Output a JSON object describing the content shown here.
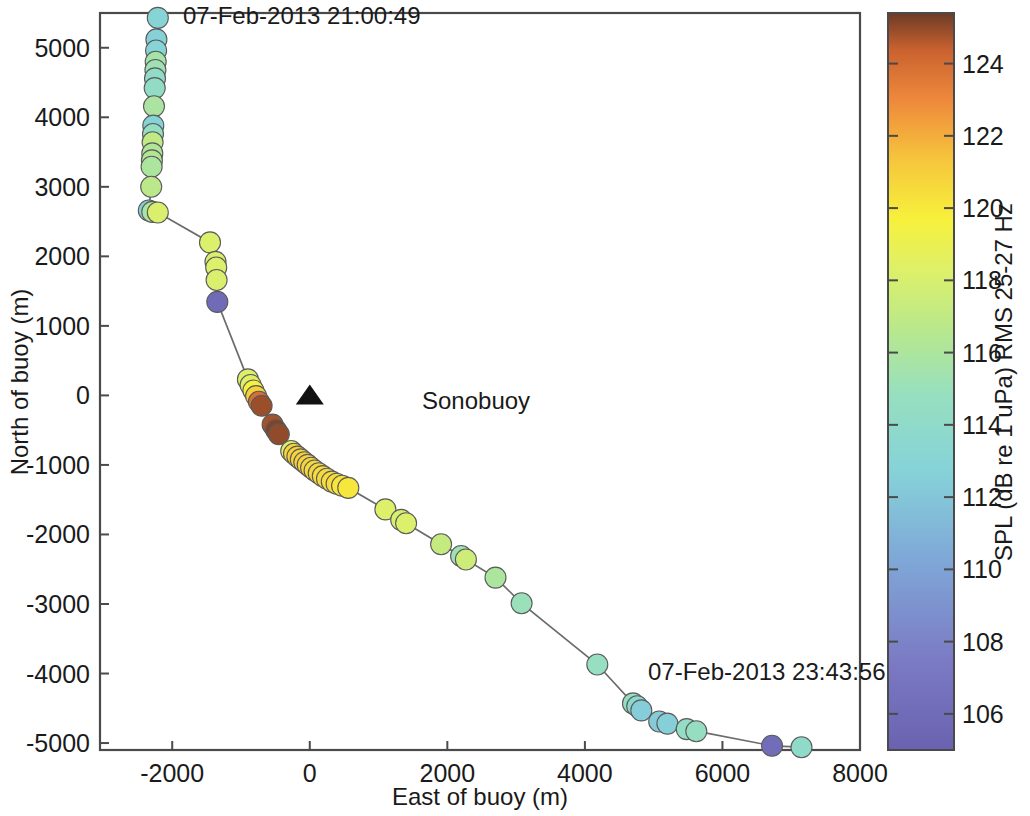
{
  "chart_data": {
    "type": "scatter",
    "title": "",
    "xlabel": "East of buoy (m)",
    "ylabel": "North of buoy (m)",
    "xlim": [
      -3050,
      8000
    ],
    "ylim": [
      -5100,
      5500
    ],
    "xticks": [
      -2000,
      0,
      2000,
      4000,
      6000,
      8000
    ],
    "xtick_labels": [
      "-2000",
      "0",
      "2000",
      "4000",
      "6000",
      "8000"
    ],
    "yticks": [
      -5000,
      -4000,
      -3000,
      -2000,
      -1000,
      0,
      1000,
      2000,
      3000,
      4000,
      5000
    ],
    "ytick_labels": [
      "-5000",
      "-4000",
      "-3000",
      "-2000",
      "-1000",
      "0",
      "1000",
      "2000",
      "3000",
      "4000",
      "5000"
    ],
    "grid": false,
    "legend_position": "inline-annotation",
    "colorbar": {
      "label": "SPL (dB re 1 uPa) RMS 25-27 Hz",
      "vmin": 105.0,
      "vmax": 125.4,
      "ticks": [
        106,
        108,
        110,
        112,
        114,
        116,
        118,
        120,
        122,
        124
      ],
      "tick_labels": [
        "106",
        "108",
        "110",
        "112",
        "114",
        "116",
        "118",
        "120",
        "122",
        "124"
      ],
      "colormap": "jet-like",
      "stops": [
        {
          "pos": 0.0,
          "hex": "#6a62b0"
        },
        {
          "pos": 0.12,
          "hex": "#7b7ac4"
        },
        {
          "pos": 0.26,
          "hex": "#7fa8d8"
        },
        {
          "pos": 0.38,
          "hex": "#86d3d8"
        },
        {
          "pos": 0.48,
          "hex": "#96dfc0"
        },
        {
          "pos": 0.57,
          "hex": "#b8e88c"
        },
        {
          "pos": 0.65,
          "hex": "#ddf06a"
        },
        {
          "pos": 0.72,
          "hex": "#f7f13c"
        },
        {
          "pos": 0.8,
          "hex": "#f6c63c"
        },
        {
          "pos": 0.88,
          "hex": "#ef8a3c"
        },
        {
          "pos": 0.95,
          "hex": "#c9622f"
        },
        {
          "pos": 1.0,
          "hex": "#6d3b26"
        }
      ]
    },
    "annotations": [
      {
        "name": "start-time",
        "text": "07-Feb-2013 21:00:49",
        "x": -2200,
        "y": 5430
      },
      {
        "name": "end-time",
        "text": "07-Feb-2013 23:43:56",
        "x": 5150,
        "y": -4200
      },
      {
        "name": "sonobuoy-label",
        "text": "Sonobuoy",
        "x": 300,
        "y": 0
      }
    ],
    "sonobuoy": {
      "x": 0,
      "y": 0,
      "marker": "triangle",
      "color": "#111111",
      "label": "Sonobuoy"
    },
    "points": [
      {
        "x": -2210,
        "y": 5430,
        "v": 112.9
      },
      {
        "x": -2230,
        "y": 5120,
        "v": 112.6
      },
      {
        "x": -2235,
        "y": 4960,
        "v": 112.9
      },
      {
        "x": -2240,
        "y": 4800,
        "v": 115.6
      },
      {
        "x": -2245,
        "y": 4680,
        "v": 115.3
      },
      {
        "x": -2250,
        "y": 4560,
        "v": 114.1
      },
      {
        "x": -2255,
        "y": 4420,
        "v": 114.3
      },
      {
        "x": -2265,
        "y": 4160,
        "v": 115.9
      },
      {
        "x": -2275,
        "y": 3880,
        "v": 112.8
      },
      {
        "x": -2280,
        "y": 3760,
        "v": 114.6
      },
      {
        "x": -2285,
        "y": 3640,
        "v": 117.0
      },
      {
        "x": -2290,
        "y": 3480,
        "v": 116.2
      },
      {
        "x": -2295,
        "y": 3380,
        "v": 116.3
      },
      {
        "x": -2300,
        "y": 3290,
        "v": 116.0
      },
      {
        "x": -2305,
        "y": 3000,
        "v": 116.7
      },
      {
        "x": -2340,
        "y": 2660,
        "v": 112.6
      },
      {
        "x": -2290,
        "y": 2640,
        "v": 116.0
      },
      {
        "x": -2210,
        "y": 2630,
        "v": 118.1
      },
      {
        "x": -1450,
        "y": 2200,
        "v": 118.2
      },
      {
        "x": -1370,
        "y": 1920,
        "v": 118.1
      },
      {
        "x": -1360,
        "y": 1840,
        "v": 118.2
      },
      {
        "x": -1355,
        "y": 1660,
        "v": 118.1
      },
      {
        "x": -1345,
        "y": 1345,
        "v": 105.9
      },
      {
        "x": -900,
        "y": 230,
        "v": 118.2
      },
      {
        "x": -860,
        "y": 150,
        "v": 118.4
      },
      {
        "x": -820,
        "y": 70,
        "v": 119.6
      },
      {
        "x": -780,
        "y": -10,
        "v": 120.9
      },
      {
        "x": -740,
        "y": -90,
        "v": 123.9
      },
      {
        "x": -700,
        "y": -150,
        "v": 124.9
      },
      {
        "x": -540,
        "y": -420,
        "v": 124.8
      },
      {
        "x": -490,
        "y": -500,
        "v": 125.2
      },
      {
        "x": -450,
        "y": -560,
        "v": 125.0
      },
      {
        "x": -270,
        "y": -800,
        "v": 118.5
      },
      {
        "x": -230,
        "y": -840,
        "v": 120.7
      },
      {
        "x": -180,
        "y": -880,
        "v": 120.9
      },
      {
        "x": -130,
        "y": -920,
        "v": 120.8
      },
      {
        "x": -80,
        "y": -960,
        "v": 120.9
      },
      {
        "x": -30,
        "y": -1000,
        "v": 120.7
      },
      {
        "x": 20,
        "y": -1040,
        "v": 120.8
      },
      {
        "x": 70,
        "y": -1080,
        "v": 120.6
      },
      {
        "x": 130,
        "y": -1120,
        "v": 120.7
      },
      {
        "x": 190,
        "y": -1160,
        "v": 120.5
      },
      {
        "x": 250,
        "y": -1200,
        "v": 120.6
      },
      {
        "x": 320,
        "y": -1240,
        "v": 120.4
      },
      {
        "x": 390,
        "y": -1270,
        "v": 120.5
      },
      {
        "x": 470,
        "y": -1300,
        "v": 120.2
      },
      {
        "x": 560,
        "y": -1330,
        "v": 120.1
      },
      {
        "x": 1100,
        "y": -1640,
        "v": 118.3
      },
      {
        "x": 1330,
        "y": -1790,
        "v": 118.0
      },
      {
        "x": 1400,
        "y": -1840,
        "v": 118.2
      },
      {
        "x": 1910,
        "y": -2140,
        "v": 117.2
      },
      {
        "x": 2200,
        "y": -2310,
        "v": 115.2
      },
      {
        "x": 2270,
        "y": -2360,
        "v": 117.6
      },
      {
        "x": 2700,
        "y": -2620,
        "v": 116.0
      },
      {
        "x": 3080,
        "y": -2990,
        "v": 115.0
      },
      {
        "x": 4180,
        "y": -3870,
        "v": 114.8
      },
      {
        "x": 4700,
        "y": -4430,
        "v": 114.6
      },
      {
        "x": 4760,
        "y": -4470,
        "v": 113.6
      },
      {
        "x": 4820,
        "y": -4530,
        "v": 112.4
      },
      {
        "x": 5080,
        "y": -4690,
        "v": 112.3
      },
      {
        "x": 5200,
        "y": -4720,
        "v": 112.5
      },
      {
        "x": 5480,
        "y": -4800,
        "v": 114.4
      },
      {
        "x": 5620,
        "y": -4830,
        "v": 114.7
      },
      {
        "x": 6720,
        "y": -5040,
        "v": 106.1
      },
      {
        "x": 7150,
        "y": -5060,
        "v": 114.0
      }
    ]
  }
}
